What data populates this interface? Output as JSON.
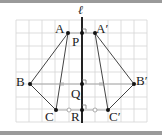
{
  "diagram": {
    "axis_label": "ℓ",
    "points": {
      "A": {
        "label": "A"
      },
      "A_prime": {
        "label": "A′"
      },
      "B": {
        "label": "B"
      },
      "B_prime": {
        "label": "B′"
      },
      "C": {
        "label": "C"
      },
      "C_prime": {
        "label": "C′"
      },
      "P": {
        "label": "P"
      },
      "Q": {
        "label": "Q"
      },
      "R": {
        "label": "R"
      }
    },
    "colors": {
      "grid": "#cfcfcf",
      "line": "#333333",
      "axis": "#222222",
      "frame": "#9a9a9a",
      "hollow_point": "#999999"
    }
  }
}
